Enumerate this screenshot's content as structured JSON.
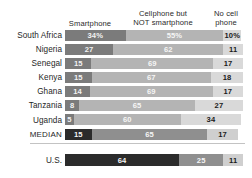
{
  "chart_data": {
    "type": "bar",
    "subtype": "stacked-horizontal-100pct",
    "title": "",
    "xlabel": "",
    "ylabel": "",
    "xlim": [
      0,
      100
    ],
    "grid": false,
    "legend_position": "top-as-column-headers",
    "categories": [
      "South Africa",
      "Nigeria",
      "Senegal",
      "Kenya",
      "Ghana",
      "Tanzania",
      "Uganda",
      "MEDIAN",
      "U.S."
    ],
    "series": [
      {
        "name": "Smartphone",
        "values": [
          34,
          27,
          15,
          15,
          14,
          8,
          5,
          15,
          64
        ]
      },
      {
        "name": "Cellphone but NOT smartphone",
        "values": [
          55,
          62,
          69,
          67,
          69,
          65,
          60,
          65,
          25
        ]
      },
      {
        "name": "No cell phone",
        "values": [
          10,
          11,
          17,
          18,
          17,
          27,
          34,
          17,
          11
        ]
      }
    ],
    "colors": {
      "smartphone": "#7b7b7b",
      "cellphone_not_smartphone": "#b4b4b4",
      "no_cell_phone": "#d9d9d9",
      "smartphone_highlight": "#2b2b2b",
      "cellphone_highlight": "#8f8f8f",
      "no_cell_highlight": "#cfcfcf",
      "background": "#ffffff",
      "rule": "#c3c3c3"
    }
  },
  "header": {
    "smartphone": "Smartphone",
    "cellphone_line1": "Cellphone but",
    "cellphone_line2": "NOT smartphone",
    "nocell_line1": "No cell",
    "nocell_line2": "phone"
  },
  "rows": [
    {
      "label": "South Africa",
      "highlight": false,
      "separator_after": false,
      "segments": [
        {
          "key": "smartphone",
          "value": 34,
          "text": "34%",
          "label_inside": true
        },
        {
          "key": "cellphone",
          "value": 55,
          "text": "55%",
          "label_inside": true
        },
        {
          "key": "nocell",
          "value": 10,
          "text": "10%",
          "label_inside": true
        }
      ]
    },
    {
      "label": "Nigeria",
      "highlight": false,
      "separator_after": false,
      "segments": [
        {
          "key": "smartphone",
          "value": 27,
          "text": "27",
          "label_inside": true
        },
        {
          "key": "cellphone",
          "value": 62,
          "text": "62",
          "label_inside": true
        },
        {
          "key": "nocell",
          "value": 11,
          "text": "11",
          "label_inside": true
        }
      ]
    },
    {
      "label": "Senegal",
      "highlight": false,
      "separator_after": false,
      "segments": [
        {
          "key": "smartphone",
          "value": 15,
          "text": "15",
          "label_inside": true
        },
        {
          "key": "cellphone",
          "value": 69,
          "text": "69",
          "label_inside": true
        },
        {
          "key": "nocell",
          "value": 17,
          "text": "17",
          "label_inside": true
        }
      ]
    },
    {
      "label": "Kenya",
      "highlight": false,
      "separator_after": false,
      "segments": [
        {
          "key": "smartphone",
          "value": 15,
          "text": "15",
          "label_inside": true
        },
        {
          "key": "cellphone",
          "value": 67,
          "text": "67",
          "label_inside": true
        },
        {
          "key": "nocell",
          "value": 18,
          "text": "18",
          "label_inside": true
        }
      ]
    },
    {
      "label": "Ghana",
      "highlight": false,
      "separator_after": false,
      "segments": [
        {
          "key": "smartphone",
          "value": 14,
          "text": "14",
          "label_inside": true
        },
        {
          "key": "cellphone",
          "value": 69,
          "text": "69",
          "label_inside": true
        },
        {
          "key": "nocell",
          "value": 17,
          "text": "17",
          "label_inside": true
        }
      ]
    },
    {
      "label": "Tanzania",
      "highlight": false,
      "separator_after": false,
      "segments": [
        {
          "key": "smartphone",
          "value": 8,
          "text": "8",
          "label_inside": true
        },
        {
          "key": "cellphone",
          "value": 65,
          "text": "65",
          "label_inside": true
        },
        {
          "key": "nocell",
          "value": 27,
          "text": "27",
          "label_inside": true
        }
      ]
    },
    {
      "label": "Uganda",
      "highlight": false,
      "separator_after": false,
      "segments": [
        {
          "key": "smartphone",
          "value": 5,
          "text": "5",
          "label_inside": true
        },
        {
          "key": "cellphone",
          "value": 60,
          "text": "60",
          "label_inside": true
        },
        {
          "key": "nocell",
          "value": 34,
          "text": "34",
          "label_inside": true
        }
      ]
    },
    {
      "label": "MEDIAN",
      "highlight": true,
      "separator_after": true,
      "segments": [
        {
          "key": "smartphone",
          "value": 15,
          "text": "15",
          "label_inside": true
        },
        {
          "key": "cellphone",
          "value": 65,
          "text": "65",
          "label_inside": true
        },
        {
          "key": "nocell",
          "value": 17,
          "text": "17",
          "label_inside": true
        }
      ]
    },
    {
      "label": "U.S.",
      "highlight": true,
      "separator_after": false,
      "segments": [
        {
          "key": "smartphone",
          "value": 64,
          "text": "64",
          "label_inside": true
        },
        {
          "key": "cellphone",
          "value": 25,
          "text": "25",
          "label_inside": true
        },
        {
          "key": "nocell",
          "value": 11,
          "text": "11",
          "label_inside": true
        }
      ]
    }
  ]
}
